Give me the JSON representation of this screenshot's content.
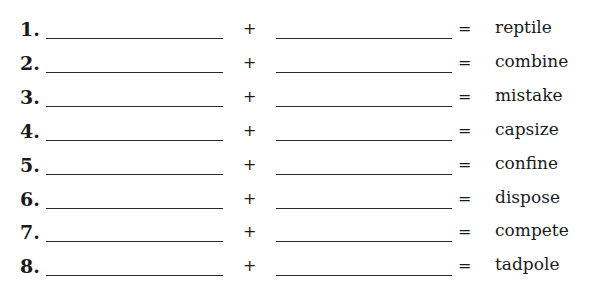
{
  "worksheet": {
    "rows": [
      {
        "number": "1.",
        "plus": "+",
        "equals": "=",
        "word": "reptile"
      },
      {
        "number": "2.",
        "plus": "+",
        "equals": "=",
        "word": "combine"
      },
      {
        "number": "3.",
        "plus": "+",
        "equals": "=",
        "word": "mistake"
      },
      {
        "number": "4.",
        "plus": "+",
        "equals": "=",
        "word": "capsize"
      },
      {
        "number": "5.",
        "plus": "+",
        "equals": "=",
        "word": "confine"
      },
      {
        "number": "6.",
        "plus": "+",
        "equals": "=",
        "word": "dispose"
      },
      {
        "number": "7.",
        "plus": "+",
        "equals": "=",
        "word": "compete"
      },
      {
        "number": "8.",
        "plus": "+",
        "equals": "=",
        "word": "tadpole"
      }
    ]
  }
}
